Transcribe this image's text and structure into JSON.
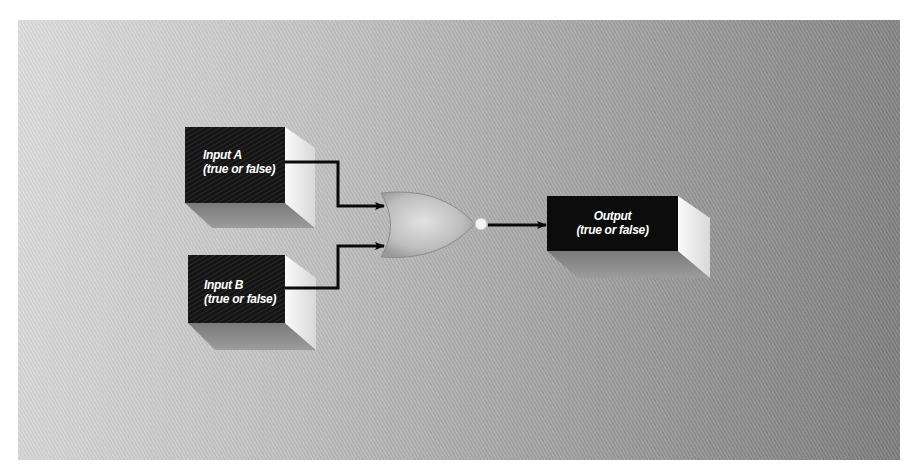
{
  "diagram": {
    "type": "logic-gate",
    "gate": {
      "kind": "NOR",
      "icon": "nor-gate-icon"
    },
    "nodes": [
      {
        "id": "input_a",
        "title": "Input A",
        "subtitle": "(true or false)"
      },
      {
        "id": "input_b",
        "title": "Input B",
        "subtitle": "(true or false)"
      },
      {
        "id": "output",
        "title": "Output",
        "subtitle": "(true or false)"
      }
    ],
    "edges": [
      {
        "from": "input_a",
        "to": "gate"
      },
      {
        "from": "input_b",
        "to": "gate"
      },
      {
        "from": "gate",
        "to": "output"
      }
    ],
    "colors": {
      "box_front": "#111111",
      "box_side": "#f2f2f2",
      "wire": "#0a0a0a",
      "text": "#ffffff"
    }
  }
}
